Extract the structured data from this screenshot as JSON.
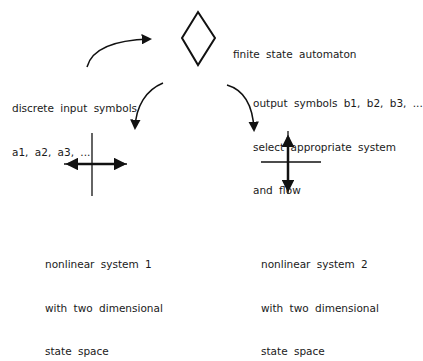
{
  "diagram": {
    "type": "flow-diagram",
    "nodes": {
      "automaton": {
        "shape": "diamond",
        "label": "finite state automaton"
      },
      "input": {
        "lines": [
          "discrete input symbols",
          "a1, a2, a3, ..."
        ]
      },
      "output": {
        "lines": [
          "output symbols b1, b2, b3, ...",
          "select appropriate system",
          "and flow"
        ]
      },
      "system1": {
        "glyph": "horizontal-outflow-cross",
        "lines": [
          "nonlinear system 1",
          "with two dimensional",
          "state space"
        ]
      },
      "system2": {
        "glyph": "vertical-outflow-cross",
        "lines": [
          "nonlinear system 2",
          "with two dimensional",
          "state space"
        ]
      }
    },
    "edges": [
      {
        "from": "input",
        "to": "automaton"
      },
      {
        "from": "automaton",
        "to": "system1"
      },
      {
        "from": "automaton",
        "to": "system2"
      }
    ],
    "colors": {
      "stroke": "#111111",
      "background": "#ffffff"
    }
  }
}
